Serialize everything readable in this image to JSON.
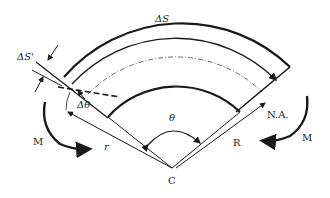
{
  "diagram": {
    "labels": {
      "delta_s": "ΔS",
      "delta_s_prime": "ΔS'",
      "delta_theta": "Δθ",
      "theta": "θ",
      "r": "r",
      "R": "R",
      "na": "N.A.",
      "center": "C",
      "moment_left": "M",
      "moment_right": "M"
    },
    "colors": {
      "stroke": "#1a1a1a",
      "text": "#222222",
      "background": "#ffffff"
    }
  }
}
